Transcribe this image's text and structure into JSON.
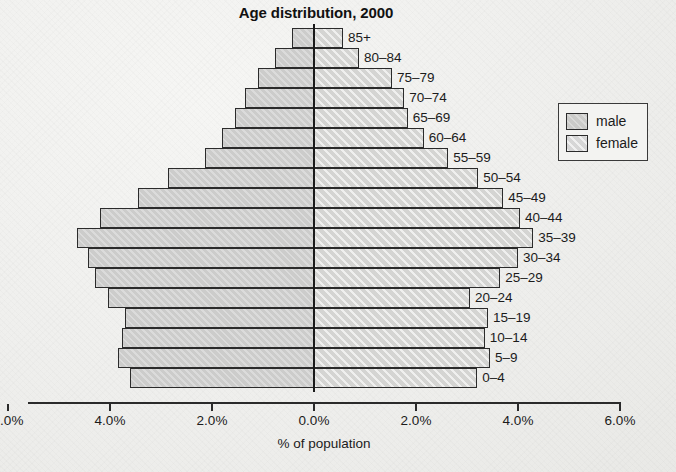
{
  "chart_data": {
    "type": "bar",
    "subtype": "population-pyramid",
    "title": "Age distribution, 2000",
    "xlabel": "% of population",
    "ylabel": "",
    "categories": [
      "0–4",
      "5–9",
      "10–14",
      "15–19",
      "20–24",
      "25–29",
      "30–34",
      "35–39",
      "40–44",
      "45–49",
      "50–54",
      "55–59",
      "60–64",
      "65–69",
      "70–74",
      "75–79",
      "80–84",
      "85+"
    ],
    "series": [
      {
        "name": "male",
        "side": "left",
        "color": "#cccccb",
        "values": [
          3.6,
          3.84,
          3.76,
          3.7,
          4.04,
          4.3,
          4.43,
          4.65,
          4.2,
          3.45,
          2.86,
          2.14,
          1.8,
          1.55,
          1.35,
          1.1,
          0.76,
          0.43
        ]
      },
      {
        "name": "female",
        "side": "right",
        "color": "#dcdcda",
        "values": [
          3.2,
          3.45,
          3.35,
          3.41,
          3.06,
          3.65,
          4.0,
          4.3,
          4.04,
          3.71,
          3.22,
          2.63,
          2.15,
          1.84,
          1.77,
          1.53,
          0.88,
          0.57
        ]
      }
    ],
    "xticks": [
      {
        "value": -6.0,
        "label": "6.0%",
        "clipped": true
      },
      {
        "value": -4.0,
        "label": "4.0%"
      },
      {
        "value": -2.0,
        "label": "2.0%"
      },
      {
        "value": 0.0,
        "label": "0.0%"
      },
      {
        "value": 2.0,
        "label": "2.0%"
      },
      {
        "value": 4.0,
        "label": "4.0%"
      },
      {
        "value": 6.0,
        "label": "6.0%"
      }
    ],
    "xlim": [
      -6.0,
      6.0
    ],
    "grid": false,
    "legend": {
      "position": "right",
      "entries": [
        {
          "label": "male",
          "color": "#cccccb"
        },
        {
          "label": "female",
          "color": "#dcdcda"
        }
      ]
    }
  },
  "legend": {
    "male_label": "male",
    "female_label": "female"
  },
  "axis": {
    "caption": "% of population"
  }
}
